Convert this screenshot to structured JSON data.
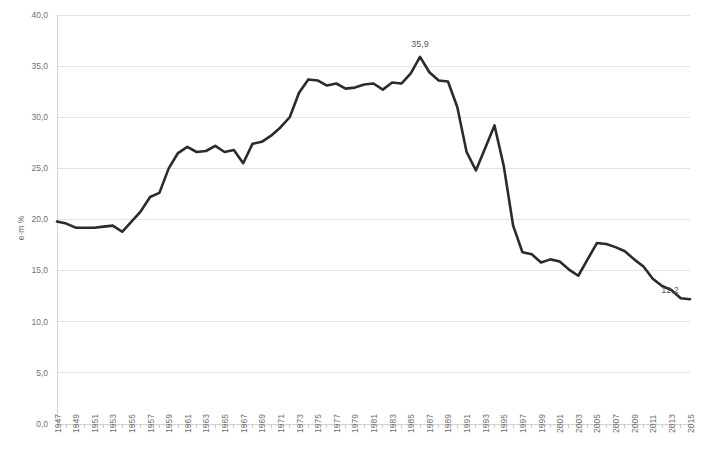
{
  "chart_data": {
    "type": "line",
    "title": "",
    "subtitle": "",
    "xlabel": "",
    "ylabel": "e·m %",
    "xlim": [
      1947,
      2015
    ],
    "ylim": [
      0.0,
      40.0
    ],
    "grid": true,
    "legend": false,
    "legend_position": "none",
    "y_tick_labels": [
      "0,0",
      "5,0",
      "10,0",
      "15,0",
      "20,0",
      "25,0",
      "30,0",
      "35,0",
      "40,0"
    ],
    "y_tick_values": [
      0,
      5,
      10,
      15,
      20,
      25,
      30,
      35,
      40
    ],
    "x_tick_labels": [
      "1947",
      "1949",
      "1951",
      "1953",
      "1955",
      "1957",
      "1959",
      "1961",
      "1963",
      "1965",
      "1967",
      "1969",
      "1971",
      "1973",
      "1975",
      "1977",
      "1979",
      "1981",
      "1983",
      "1985",
      "1987",
      "1989",
      "1991",
      "1993",
      "1995",
      "1997",
      "1999",
      "2001",
      "2003",
      "2005",
      "2007",
      "2009",
      "2011",
      "2013",
      "2015"
    ],
    "x_tick_step": 2,
    "x": [
      1947,
      1948,
      1949,
      1950,
      1951,
      1952,
      1953,
      1954,
      1955,
      1956,
      1957,
      1958,
      1959,
      1960,
      1961,
      1962,
      1963,
      1964,
      1965,
      1966,
      1967,
      1968,
      1969,
      1970,
      1971,
      1972,
      1973,
      1974,
      1975,
      1976,
      1977,
      1978,
      1979,
      1980,
      1981,
      1982,
      1983,
      1984,
      1985,
      1986,
      1987,
      1988,
      1989,
      1990,
      1991,
      1992,
      1993,
      1994,
      1995,
      1996,
      1997,
      1998,
      1999,
      2000,
      2001,
      2002,
      2003,
      2004,
      2005,
      2006,
      2007,
      2008,
      2009,
      2010,
      2011,
      2012,
      2013,
      2014,
      2015
    ],
    "values": [
      19.8,
      19.6,
      19.2,
      19.2,
      19.2,
      19.3,
      19.4,
      18.8,
      19.8,
      20.8,
      22.2,
      22.6,
      25.0,
      26.5,
      27.1,
      26.6,
      26.7,
      27.2,
      26.6,
      26.8,
      25.5,
      27.4,
      27.6,
      28.2,
      29.0,
      30.0,
      32.4,
      33.7,
      33.6,
      33.1,
      33.3,
      32.8,
      32.9,
      33.2,
      33.3,
      32.7,
      33.4,
      33.3,
      34.3,
      35.9,
      34.4,
      33.6,
      33.5,
      31.0,
      26.6,
      24.8,
      27.0,
      29.2,
      25.2,
      19.4,
      16.8,
      16.6,
      15.8,
      16.1,
      15.9,
      15.1,
      14.5,
      16.1,
      17.7,
      17.6,
      17.3,
      16.9,
      16.1,
      15.4,
      14.2,
      13.5,
      13.1,
      12.3,
      12.2
    ],
    "series_color": "#2b2b2b",
    "annotations": [
      {
        "name": "peak-value-label",
        "text": "35,9",
        "x": 1986,
        "y": 35.9
      },
      {
        "name": "end-value-label",
        "text": "12,2",
        "x": 2015,
        "y": 12.2
      }
    ]
  }
}
